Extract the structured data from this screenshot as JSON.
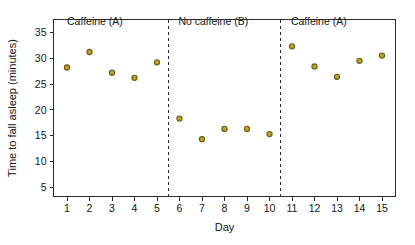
{
  "chart_data": {
    "type": "scatter",
    "title": "",
    "xlabel": "Day",
    "ylabel": "Time to fall asleep (minutes)",
    "xlim": [
      0.4,
      15.6
    ],
    "ylim": [
      3.2,
      37.5
    ],
    "grid": false,
    "legend": "none",
    "marker_color": "#b9a42a",
    "marker_edge_color": "#6b5e12",
    "x": [
      1,
      2,
      3,
      4,
      5,
      6,
      7,
      8,
      9,
      10,
      11,
      12,
      13,
      14,
      15
    ],
    "values": [
      28.2,
      31.2,
      27.2,
      26.2,
      29.2,
      18.3,
      14.3,
      16.3,
      16.3,
      15.3,
      32.3,
      28.4,
      26.4,
      29.5,
      30.5
    ],
    "xticks": [
      1,
      2,
      3,
      4,
      5,
      6,
      7,
      8,
      9,
      10,
      11,
      12,
      13,
      14,
      15
    ],
    "xticklabels": [
      "1",
      "2",
      "3",
      "4",
      "5",
      "6",
      "7",
      "8",
      "9",
      "10",
      "11",
      "12",
      "13",
      "14",
      "15"
    ],
    "yticks": [
      5,
      10,
      15,
      20,
      25,
      30,
      35
    ],
    "yticklabels": [
      "5",
      "10",
      "15",
      "20",
      "25",
      "30",
      "35"
    ],
    "dividers": [
      5.5,
      10.5
    ],
    "annotations": [
      {
        "text": "Caffeine (A)",
        "x": 1.0,
        "y": 36.4
      },
      {
        "text": "No caffeine (B)",
        "x": 5.95,
        "y": 36.4
      },
      {
        "text": "Caffeine (A)",
        "x": 10.95,
        "y": 36.4
      }
    ]
  }
}
